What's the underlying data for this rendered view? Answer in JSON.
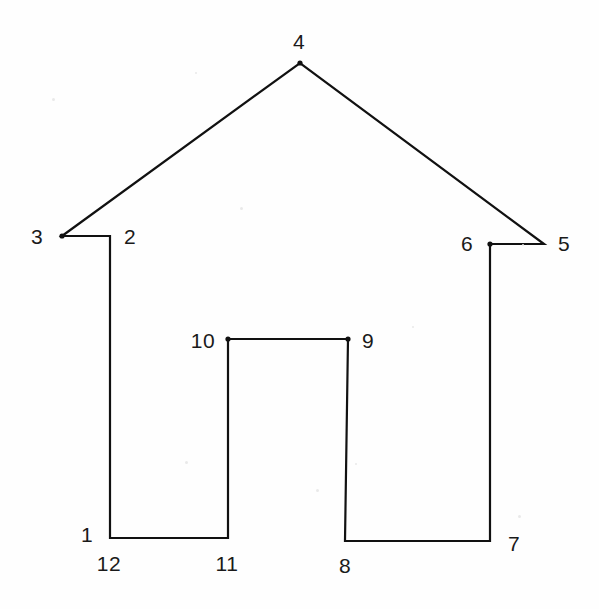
{
  "figure": {
    "kind": "line-drawing",
    "background_color": "#fefefe",
    "stroke_color": "#111111",
    "label_color": "#1a1a1a",
    "width": 599,
    "height": 609
  },
  "shape": {
    "closed": true,
    "path": "110,538 110,236 62,236 300,63 544,244 490,244 490,541 345,541 348,339 228,339 228,538 110,538",
    "vertices": [
      {
        "id": "1",
        "x": 110,
        "y": 538
      },
      {
        "id": "2",
        "x": 110,
        "y": 236
      },
      {
        "id": "3",
        "x": 62,
        "y": 236
      },
      {
        "id": "4",
        "x": 300,
        "y": 63
      },
      {
        "id": "5",
        "x": 544,
        "y": 244
      },
      {
        "id": "6",
        "x": 490,
        "y": 244
      },
      {
        "id": "7",
        "x": 490,
        "y": 541
      },
      {
        "id": "8",
        "x": 345,
        "y": 541
      },
      {
        "id": "9",
        "x": 348,
        "y": 339
      },
      {
        "id": "10",
        "x": 228,
        "y": 339
      },
      {
        "id": "11",
        "x": 228,
        "y": 538
      },
      {
        "id": "12",
        "x": 110,
        "y": 538
      }
    ],
    "marked_dots": [
      {
        "id": "3",
        "x": 62,
        "y": 236
      },
      {
        "id": "4",
        "x": 300,
        "y": 63
      },
      {
        "id": "6",
        "x": 490,
        "y": 244
      },
      {
        "id": "9",
        "x": 348,
        "y": 339
      },
      {
        "id": "10",
        "x": 228,
        "y": 339
      }
    ]
  },
  "labels": [
    {
      "text": "1",
      "x": 87,
      "y": 534
    },
    {
      "text": "2",
      "x": 130,
      "y": 236
    },
    {
      "text": "3",
      "x": 37,
      "y": 236
    },
    {
      "text": "4",
      "x": 299,
      "y": 41
    },
    {
      "text": "5",
      "x": 564,
      "y": 243
    },
    {
      "text": "6",
      "x": 467,
      "y": 243
    },
    {
      "text": "7",
      "x": 514,
      "y": 543
    },
    {
      "text": "8",
      "x": 345,
      "y": 565
    },
    {
      "text": "9",
      "x": 368,
      "y": 340
    },
    {
      "text": "10",
      "x": 203,
      "y": 340
    },
    {
      "text": "11",
      "x": 227,
      "y": 563
    },
    {
      "text": "12",
      "x": 109,
      "y": 563
    }
  ],
  "speckles": [
    {
      "x": 52,
      "y": 98,
      "size": 3
    },
    {
      "x": 195,
      "y": 72,
      "size": 2
    },
    {
      "x": 240,
      "y": 207,
      "size": 3
    },
    {
      "x": 185,
      "y": 461,
      "size": 3
    },
    {
      "x": 316,
      "y": 489,
      "size": 3
    },
    {
      "x": 355,
      "y": 463,
      "size": 2
    },
    {
      "x": 522,
      "y": 244,
      "size": 2
    },
    {
      "x": 518,
      "y": 515,
      "size": 3
    },
    {
      "x": 412,
      "y": 326,
      "size": 2
    }
  ]
}
